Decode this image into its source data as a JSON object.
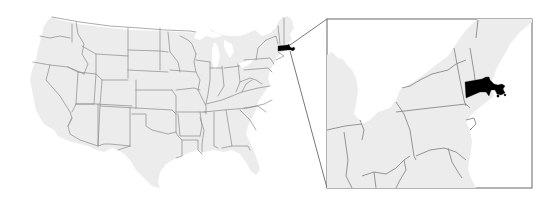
{
  "map": {
    "type": "locator_map",
    "region": "Contiguous United States",
    "highlighted_state": "Massachusetts",
    "highlight_color": "#000000",
    "land_color": "#ececec",
    "border_color": "#8a8a8a",
    "background_color": "#ffffff",
    "inset": {
      "region": "Northeastern United States",
      "frame_color": "#666666",
      "connector_color": "#555555"
    }
  }
}
